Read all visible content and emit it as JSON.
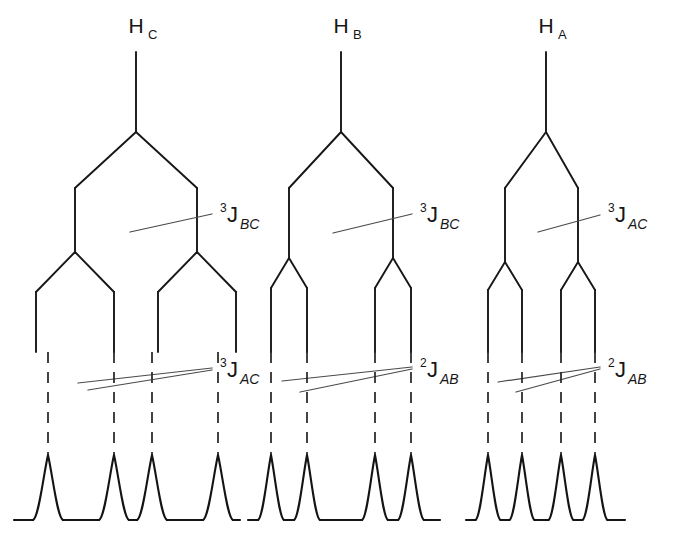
{
  "figure": {
    "type": "nmr-splitting-tree-diagram",
    "background_color": "#ffffff",
    "line_color": "#171717",
    "leader_color": "#4a4a4a",
    "width": 677,
    "height": 554
  },
  "trees": [
    {
      "id": "tree-hc",
      "header": {
        "element": "H",
        "subscript": "C"
      },
      "header_x": 136,
      "header_y": 33,
      "trunk": {
        "x": 136,
        "y_top": 52,
        "y_bottom": 132
      },
      "split1": {
        "label": {
          "superscript": "3",
          "letter": "J",
          "subscript": "BC"
        },
        "label_x": 220,
        "label_y": 222,
        "y_node": 132,
        "y_spread": 188,
        "y_stem_end": 252,
        "left_x": 75,
        "right_x": 197,
        "leader": {
          "x1": 130,
          "y1": 232,
          "x2": 212,
          "y2": 214
        }
      },
      "split2": {
        "label": {
          "superscript": "3",
          "letter": "J",
          "subscript": "AC"
        },
        "label_x": 220,
        "label_y": 377,
        "y_node": 252,
        "y_spread": 292,
        "y_stem_end": 352,
        "offset": 39,
        "leaves": [
          48,
          114,
          152,
          218
        ],
        "leaders": [
          {
            "x1": 78,
            "y1": 383,
            "x2": 212,
            "y2": 368
          },
          {
            "x1": 88,
            "y1": 390,
            "x2": 212,
            "y2": 370
          }
        ]
      },
      "dashes": {
        "y_top": 352,
        "y_bottom": 455
      },
      "peaks": {
        "positions": [
          48,
          114,
          152,
          218
        ],
        "width": 30,
        "y_top": 455,
        "y_base": 520,
        "baseline_left": 14,
        "baseline_right": 240
      }
    },
    {
      "id": "tree-hb",
      "header": {
        "element": "H",
        "subscript": "B"
      },
      "header_x": 341,
      "header_y": 33,
      "trunk": {
        "x": 341,
        "y_top": 52,
        "y_bottom": 132
      },
      "split1": {
        "label": {
          "superscript": "3",
          "letter": "J",
          "subscript": "BC"
        },
        "label_x": 420,
        "label_y": 222,
        "y_node": 132,
        "y_spread": 188,
        "y_stem_end": 258,
        "left_x": 289,
        "right_x": 393,
        "leader": {
          "x1": 333,
          "y1": 233,
          "x2": 412,
          "y2": 214
        }
      },
      "split2": {
        "label": {
          "superscript": "2",
          "letter": "J",
          "subscript": "AB"
        },
        "label_x": 420,
        "label_y": 377,
        "y_node": 258,
        "y_spread": 288,
        "y_stem_end": 352,
        "offset": 18,
        "leaves": [
          271,
          307,
          375,
          411
        ],
        "leaders": [
          {
            "x1": 282,
            "y1": 381,
            "x2": 412,
            "y2": 367
          },
          {
            "x1": 300,
            "y1": 392,
            "x2": 412,
            "y2": 369
          }
        ]
      },
      "dashes": {
        "y_top": 352,
        "y_bottom": 455
      },
      "peaks": {
        "positions": [
          271,
          307,
          375,
          411
        ],
        "width": 26,
        "y_top": 455,
        "y_base": 520,
        "baseline_left": 248,
        "baseline_right": 440
      }
    },
    {
      "id": "tree-ha",
      "header": {
        "element": "H",
        "subscript": "A"
      },
      "header_x": 546,
      "header_y": 33,
      "trunk": {
        "x": 546,
        "y_top": 52,
        "y_bottom": 132
      },
      "split1": {
        "label": {
          "superscript": "3",
          "letter": "J",
          "subscript": "AC"
        },
        "label_x": 608,
        "label_y": 222,
        "y_node": 132,
        "y_spread": 188,
        "y_stem_end": 262,
        "left_x": 505,
        "right_x": 578,
        "leader": {
          "x1": 538,
          "y1": 232,
          "x2": 600,
          "y2": 215
        }
      },
      "split2": {
        "label": {
          "superscript": "2",
          "letter": "J",
          "subscript": "AB"
        },
        "label_x": 608,
        "label_y": 377,
        "y_node": 262,
        "y_spread": 290,
        "y_stem_end": 352,
        "offset": 17,
        "leaves": [
          488,
          522,
          561,
          595
        ],
        "leaders": [
          {
            "x1": 498,
            "y1": 382,
            "x2": 600,
            "y2": 367
          },
          {
            "x1": 516,
            "y1": 392,
            "x2": 600,
            "y2": 369
          }
        ]
      },
      "dashes": {
        "y_top": 352,
        "y_bottom": 455
      },
      "peaks": {
        "positions": [
          488,
          522,
          561,
          595
        ],
        "width": 25,
        "y_top": 455,
        "y_base": 520,
        "baseline_left": 466,
        "baseline_right": 625
      }
    }
  ]
}
